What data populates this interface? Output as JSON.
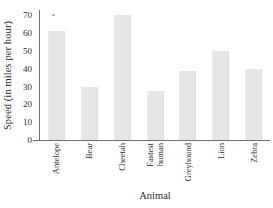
{
  "chart_data": {
    "type": "bar",
    "title": "",
    "xlabel": "Animal",
    "ylabel": "Speed (in miles per hour)",
    "categories": [
      "Antelope",
      "Bear",
      "Cheetah",
      "Fastest human",
      "Greyhound",
      "Lion",
      "Zebra"
    ],
    "category_lines": [
      [
        "Antelope"
      ],
      [
        "Bear"
      ],
      [
        "Cheetah"
      ],
      [
        "Fastest",
        "human"
      ],
      [
        "Greyhound"
      ],
      [
        "Lion"
      ],
      [
        "Zebra"
      ]
    ],
    "values": [
      61,
      30,
      70,
      27.5,
      39,
      50,
      40
    ],
    "ylim": [
      0,
      73
    ],
    "yticks": [
      0,
      10,
      20,
      30,
      40,
      50,
      60,
      70
    ],
    "ytick_labels": [
      "0",
      "10",
      "20",
      "30",
      "40",
      "50",
      "60",
      "70"
    ],
    "grid": false,
    "legend": "none",
    "bar_color": "#e6e6e6",
    "axis_color": "#6f6f6f",
    "text_color": "#2b2b2b",
    "background": "#ffffff"
  }
}
